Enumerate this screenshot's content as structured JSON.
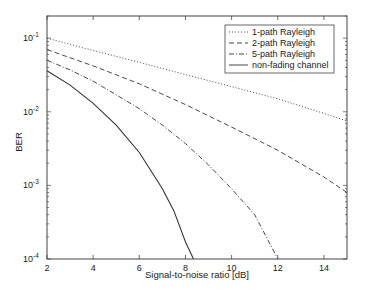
{
  "chart_data": {
    "type": "line",
    "title": "",
    "xlabel": "Signal-to-noise ratio [dB]",
    "ylabel": "BER",
    "xlim": [
      2,
      15
    ],
    "ylim": [
      0.0001,
      0.2
    ],
    "yscale": "log",
    "grid": false,
    "legend_position": "upper right",
    "x_ticks": [
      2,
      4,
      6,
      8,
      10,
      12,
      14
    ],
    "x_tick_labels": [
      "2",
      "4",
      "6",
      "8",
      "10",
      "12",
      "14"
    ],
    "y_ticks": [
      0.1,
      0.01,
      0.001,
      0.0001
    ],
    "y_tick_labels": [
      {
        "base": "10",
        "exp": "-1"
      },
      {
        "base": "10",
        "exp": "-2"
      },
      {
        "base": "10",
        "exp": "-3"
      },
      {
        "base": "10",
        "exp": "-4"
      }
    ],
    "series": [
      {
        "name": "1-path Rayleigh",
        "style": "dotted",
        "x": [
          2,
          4,
          6,
          8,
          10,
          12,
          14,
          15
        ],
        "values": [
          0.1,
          0.068,
          0.047,
          0.032,
          0.022,
          0.015,
          0.0095,
          0.0075
        ]
      },
      {
        "name": "2-path Rayleigh",
        "style": "dashed",
        "x": [
          2,
          4,
          6,
          8,
          10,
          12,
          14,
          15
        ],
        "values": [
          0.07,
          0.042,
          0.024,
          0.0125,
          0.0062,
          0.003,
          0.0013,
          0.0008
        ]
      },
      {
        "name": "5-path Rayleigh",
        "style": "dash-dot",
        "x": [
          2,
          3,
          4,
          5,
          6,
          7,
          8,
          9,
          10,
          11,
          12
        ],
        "values": [
          0.05,
          0.037,
          0.026,
          0.017,
          0.011,
          0.0066,
          0.0037,
          0.0019,
          0.0009,
          0.0004,
          0.0001
        ]
      },
      {
        "name": "non-fading channel",
        "style": "solid",
        "x": [
          2,
          3,
          4,
          5,
          6,
          7,
          7.5,
          8,
          8.35
        ],
        "values": [
          0.036,
          0.023,
          0.013,
          0.0066,
          0.0028,
          0.0009,
          0.00045,
          0.00017,
          0.0001
        ]
      }
    ]
  },
  "colors": {
    "axis": "#444444",
    "line": "#333333",
    "background": "#ffffff"
  }
}
